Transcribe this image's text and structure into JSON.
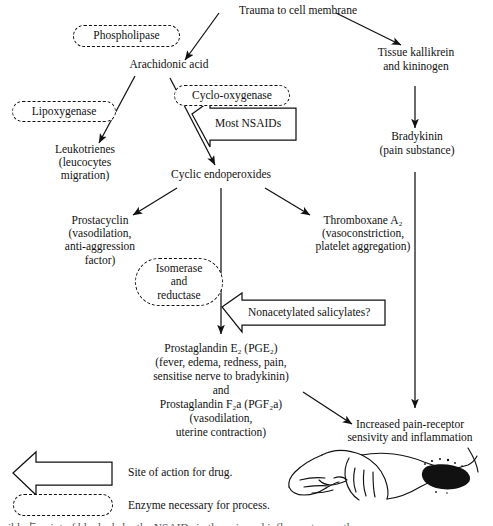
{
  "diagram": {
    "nodes": {
      "trauma": "Trauma to cell membrane",
      "arachidonic_acid": "Arachidonic acid",
      "tissue_kallikrein": "Tissue kallikrein\nand kininogen",
      "bradykinin": "Bradykinin\n(pain substance)",
      "leukotrienes": "Leukotrienes\n(leucocytes\nmigration)",
      "cyclic_endoperoxides": "Cyclic endoperoxides",
      "prostacyclin": "Prostacyclin\n(vasodilation,\nanti-aggression\nfactor)",
      "thromboxane": "Thromboxane A₂\n(vasoconstriction,\nplatelet aggregation)",
      "prostaglandin_block_line1": "Prostaglandin E₂ (PGE₂)",
      "prostaglandin_block_line2": "(fever, edema, redness, pain,",
      "prostaglandin_block_line3": "sensitise nerve to bradykinin)",
      "prostaglandin_block_line4": "and",
      "prostaglandin_block_line5": "Prostaglandin F₂a (PGF₂a)",
      "prostaglandin_block_line6": "(vasodilation,",
      "prostaglandin_block_line7": "uterine contraction)",
      "increased_pain": "Increased pain-receptor\nsensivity and inflammation"
    },
    "enzymes": {
      "phospholipase": "Phospholipase",
      "lipoxygenase": "Lipoxygenase",
      "cyclo_oxygenase": "Cyclo-oxygenase",
      "isomerase_reductase": "Isomerase\nand\nreductase"
    },
    "drug_arrows": {
      "most_nsaids": "Most NSAIDs",
      "nonacetylated_salicylates": "Nonacetylated salicylates?"
    },
    "legend": {
      "arrow_label": "Site of action for drug.",
      "capsule_label": "Enzyme necessary for process."
    },
    "caption": "ible点 point of blockade by the NSAIDs in the pain and inflammatory pathway",
    "icons": {
      "block_arrow": "left-block-arrow-icon",
      "enzyme_capsule": "dashed-capsule-icon",
      "illustration": "inflamed-arm-illustration"
    },
    "colors": {
      "ink": "#111111",
      "background": "#ffffff"
    }
  }
}
